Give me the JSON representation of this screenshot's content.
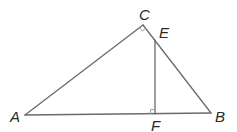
{
  "diagram": {
    "type": "geometry",
    "points": {
      "A": {
        "label": "A",
        "x": 25,
        "y": 115
      },
      "B": {
        "label": "B",
        "x": 211,
        "y": 113
      },
      "C": {
        "label": "C",
        "x": 143,
        "y": 25
      },
      "E": {
        "label": "E",
        "x": 155,
        "y": 40
      },
      "F": {
        "label": "F",
        "x": 155,
        "y": 114
      }
    },
    "segments": [
      {
        "from": "A",
        "to": "C"
      },
      {
        "from": "C",
        "to": "B"
      },
      {
        "from": "A",
        "to": "B"
      },
      {
        "from": "E",
        "to": "F"
      }
    ],
    "right_angles": [
      "C",
      "F"
    ],
    "labels": {
      "A": "A",
      "B": "B",
      "C": "C",
      "E": "E",
      "F": "F"
    },
    "colors": {
      "line": "#6a6a6a",
      "text": "#2a2a2a",
      "mark": "#9a9a9a"
    }
  }
}
